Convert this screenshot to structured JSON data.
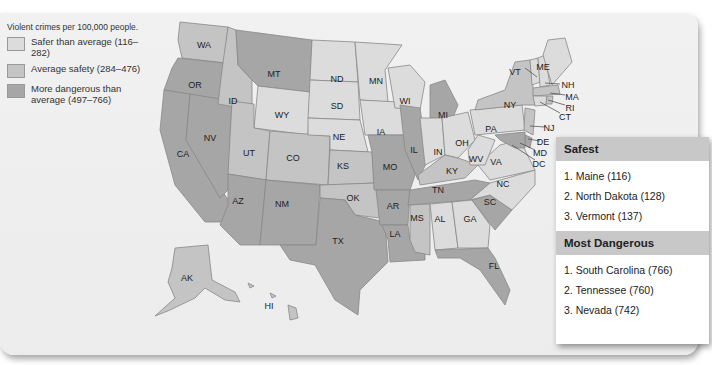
{
  "legend": {
    "title": "Violent crimes per 100,000 people.",
    "items": [
      {
        "label": "Safer than average (116–282)",
        "color": "#dcdcdc"
      },
      {
        "label": "Average safety (284–476)",
        "color": "#c4c4c4"
      },
      {
        "label": "More dangerous than average (497–766)",
        "color": "#a6a6a6"
      }
    ]
  },
  "states": {
    "WA": "WA",
    "OR": "OR",
    "CA": "CA",
    "ID": "ID",
    "NV": "NV",
    "MT": "MT",
    "WY": "WY",
    "UT": "UT",
    "AZ": "AZ",
    "CO": "CO",
    "NM": "NM",
    "ND": "ND",
    "SD": "SD",
    "NE": "NE",
    "KS": "KS",
    "OK": "OK",
    "TX": "TX",
    "MN": "MN",
    "IA": "IA",
    "MO": "MO",
    "AR": "AR",
    "LA": "LA",
    "WI": "WI",
    "IL": "IL",
    "MI": "MI",
    "IN": "IN",
    "OH": "OH",
    "KY": "KY",
    "TN": "TN",
    "MS": "MS",
    "AL": "AL",
    "GA": "GA",
    "FL": "FL",
    "SC": "SC",
    "NC": "NC",
    "VA": "VA",
    "WV": "WV",
    "PA": "PA",
    "NY": "NY",
    "VT": "VT",
    "NH": "NH",
    "ME": "ME",
    "MA": "MA",
    "RI": "RI",
    "CT": "CT",
    "NJ": "NJ",
    "DE": "DE",
    "MD": "MD",
    "DC": "DC",
    "AK": "AK",
    "HI": "HI"
  },
  "panel": {
    "safest_title": "Safest",
    "safest": [
      "1.  Maine (116)",
      "2.  North Dakota (128)",
      "3.  Vermont (137)"
    ],
    "dangerous_title": "Most Dangerous",
    "dangerous": [
      "1.  South Carolina (766)",
      "2.  Tennessee (760)",
      "3.  Nevada (742)"
    ]
  }
}
